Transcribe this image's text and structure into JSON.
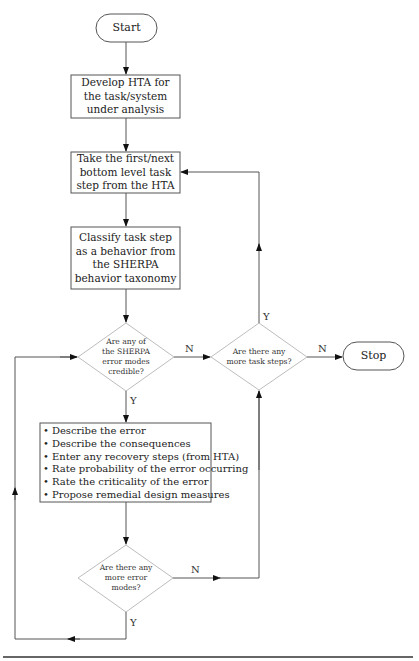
{
  "diagram": {
    "type": "flowchart",
    "nodes": {
      "start": {
        "label": "Start",
        "shape": "terminator"
      },
      "develop_hta": {
        "label": "Develop HTA for the task/system under analysis",
        "shape": "process"
      },
      "take_step": {
        "label": "Take the first/next bottom level task step from the HTA",
        "shape": "process"
      },
      "classify": {
        "label": "Classify task step as a behavior from the SHERPA behavior taxonomy",
        "shape": "process"
      },
      "credible": {
        "label": "Are any of the SHERPA error modes credible?",
        "shape": "decision"
      },
      "more_steps": {
        "label": "Are there any more task steps?",
        "shape": "decision"
      },
      "stop": {
        "label": "Stop",
        "shape": "terminator"
      },
      "describe": {
        "shape": "process",
        "items": [
          "Describe the error",
          "Describe the consequences",
          "Enter any recovery steps (from HTA)",
          "Rate probability of the error occurring",
          "Rate the criticality of the error",
          "Propose remedial design measures"
        ]
      },
      "more_errors": {
        "label": "Are there any more error modes?",
        "shape": "decision"
      }
    },
    "edge_labels": {
      "credible_no": "N",
      "credible_yes": "Y",
      "more_steps_yes": "Y",
      "more_steps_no": "N",
      "more_errors_no": "N",
      "more_errors_yes": "Y"
    },
    "edges": [
      {
        "from": "start",
        "to": "develop_hta"
      },
      {
        "from": "develop_hta",
        "to": "take_step"
      },
      {
        "from": "take_step",
        "to": "classify"
      },
      {
        "from": "classify",
        "to": "credible"
      },
      {
        "from": "credible",
        "to": "more_steps",
        "label": "N"
      },
      {
        "from": "credible",
        "to": "describe",
        "label": "Y"
      },
      {
        "from": "more_steps",
        "to": "take_step",
        "label": "Y"
      },
      {
        "from": "more_steps",
        "to": "stop",
        "label": "N"
      },
      {
        "from": "describe",
        "to": "more_errors"
      },
      {
        "from": "more_errors",
        "to": "more_steps",
        "label": "N"
      },
      {
        "from": "more_errors",
        "to": "credible",
        "label": "Y"
      }
    ]
  }
}
